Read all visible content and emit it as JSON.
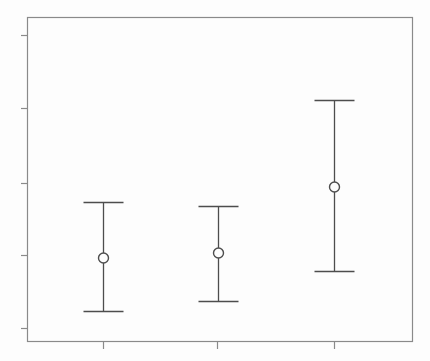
{
  "chart_data": {
    "type": "scatter",
    "title": "",
    "subtitle": "",
    "xlabel": "",
    "ylabel": "",
    "legend": [],
    "annotations": [],
    "grid": false,
    "legend_position": "none",
    "axis_labels_visible": false,
    "tick_labels_visible": false,
    "categories": [
      "1",
      "2",
      "3"
    ],
    "x": [
      1,
      2,
      3
    ],
    "values": [
      2.5,
      2.57,
      3.48
    ],
    "error_low": [
      1.77,
      1.91,
      2.31
    ],
    "error_high": [
      3.27,
      3.24,
      4.66
    ],
    "xlim": [
      0.5,
      3.5
    ],
    "ylim": [
      0.0,
      5.0
    ],
    "ytick_values": [
      4.5,
      3.5,
      2.5,
      1.5,
      0.5
    ],
    "xtick_values": [
      1,
      2,
      3
    ],
    "series": [
      {
        "name": "estimate",
        "marker": "open-circle",
        "values": [
          2.5,
          2.57,
          3.48
        ]
      }
    ],
    "points": [
      {
        "label": "1",
        "x_px": 103,
        "value": 2.5,
        "low": 1.77,
        "high": 3.27
      },
      {
        "label": "2",
        "x_px": 218,
        "value": 2.57,
        "low": 1.91,
        "high": 3.24
      },
      {
        "label": "3",
        "x_px": 334,
        "value": 3.48,
        "low": 2.31,
        "high": 4.66
      }
    ]
  },
  "geometry": {
    "plot_left": 27,
    "plot_right": 413,
    "plot_top": 17,
    "plot_bottom": 342,
    "cap_half_width": 20,
    "marker_radius": 5,
    "ytick_px": [
      35,
      108,
      183,
      255,
      328
    ],
    "xtick_px": [
      103,
      217,
      334
    ],
    "tick_length": 6,
    "bars": [
      {
        "x": 103,
        "top": 202,
        "center": 258,
        "bottom": 311
      },
      {
        "x": 218,
        "top": 206,
        "center": 253,
        "bottom": 301
      },
      {
        "x": 334,
        "top": 100,
        "center": 187,
        "bottom": 271
      }
    ]
  },
  "colors": {
    "background": "#fdfdfd",
    "plot_background": "#fdfdfd",
    "frame": "#8a8a8a",
    "axis": "#8a8a8a",
    "errorbar": "#4d4d4d",
    "marker_stroke": "#4d4d4d",
    "marker_fill": "#fdfdfd"
  }
}
